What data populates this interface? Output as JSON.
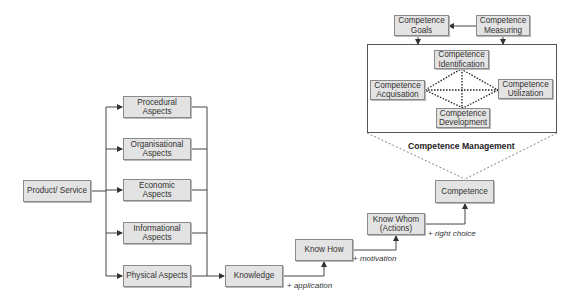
{
  "diagram": {
    "source": {
      "label": "Product/ Service"
    },
    "aspects": [
      {
        "label": "Procedural\nAspects"
      },
      {
        "label": "Organisational\nAspects"
      },
      {
        "label": "Economic\nAspects"
      },
      {
        "label": "Informational\nAspects"
      },
      {
        "label": "Physical Aspects"
      }
    ],
    "chain": [
      {
        "label": "Knowledge"
      },
      {
        "label": "Know How"
      },
      {
        "label": "Know Whom\n(Actions)"
      },
      {
        "label": "Competence"
      }
    ],
    "transitions": [
      {
        "prefix": "+ ",
        "label": "application"
      },
      {
        "prefix": "+ ",
        "label": "motivation"
      },
      {
        "prefix": "+ ",
        "label": "right choice"
      }
    ],
    "management": {
      "title": "Competence Management",
      "goals": "Competence\nGoals",
      "measuring": "Competence\nMeasuring",
      "identification": "Competence\nIdentification",
      "acquisition": "Competence\nAcquisation",
      "utilization": "Competence\nUtilization",
      "development": "Competence\nDevelopment"
    },
    "colors": {
      "box_fill": "#e3e3e3",
      "box_border": "#8a8a8a",
      "line": "#444444"
    }
  }
}
